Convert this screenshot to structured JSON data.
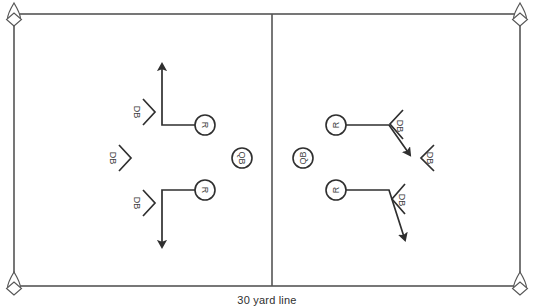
{
  "diagram": {
    "caption": "30 yard line",
    "field": {
      "stroke_color": "#555555",
      "background": "#ffffff",
      "border": {
        "x": 14,
        "y": 14,
        "width": 506,
        "height": 272
      },
      "divider_line_x": 272
    },
    "pylons": [
      {
        "name": "pylon-top-left",
        "x": 14,
        "y": 14
      },
      {
        "name": "pylon-top-right",
        "x": 520,
        "y": 14
      },
      {
        "name": "pylon-bottom-left",
        "x": 14,
        "y": 286
      },
      {
        "name": "pylon-bottom-right",
        "x": 520,
        "y": 286
      }
    ],
    "players": [
      {
        "id": "r-left-top",
        "label": "R",
        "x": 205,
        "y": 125,
        "rotation": 90,
        "role": "receiver"
      },
      {
        "id": "r-left-bottom",
        "label": "R",
        "x": 205,
        "y": 190,
        "rotation": 90,
        "role": "receiver"
      },
      {
        "id": "qb-left",
        "label": "QB",
        "x": 242,
        "y": 158,
        "rotation": 90,
        "role": "quarterback"
      },
      {
        "id": "qb-right",
        "label": "QB",
        "x": 303,
        "y": 158,
        "rotation": -90,
        "role": "quarterback"
      },
      {
        "id": "r-right-top",
        "label": "R",
        "x": 336,
        "y": 125,
        "rotation": -90,
        "role": "receiver"
      },
      {
        "id": "r-right-bottom",
        "label": "R",
        "x": 336,
        "y": 190,
        "rotation": -90,
        "role": "receiver"
      }
    ],
    "defenders": [
      {
        "id": "db-left-top",
        "label": "DB",
        "x": 142,
        "y": 112,
        "direction": "right"
      },
      {
        "id": "db-left-mid",
        "label": "DB",
        "x": 118,
        "y": 158,
        "direction": "right"
      },
      {
        "id": "db-left-bottom",
        "label": "DB",
        "x": 142,
        "y": 203,
        "direction": "right"
      },
      {
        "id": "db-right-top",
        "label": "DB",
        "x": 397,
        "y": 126,
        "direction": "left"
      },
      {
        "id": "db-right-mid",
        "label": "DB",
        "x": 428,
        "y": 158,
        "direction": "left"
      },
      {
        "id": "db-right-bottom",
        "label": "DB",
        "x": 399,
        "y": 200,
        "direction": "left"
      }
    ],
    "routes": [
      {
        "id": "route-left-top",
        "description": "receiver-in-then-up",
        "points": "196,125 162,125 162,62",
        "arrow_at": "162,60"
      },
      {
        "id": "route-left-bottom",
        "description": "receiver-in-then-down",
        "points": "196,190 162,190 162,249",
        "arrow_at": "162,251"
      },
      {
        "id": "route-right-top",
        "description": "receiver-out-diagonal",
        "points": "346,125 389,125 411,157",
        "arrow_at": "413,159"
      },
      {
        "id": "route-right-bottom",
        "description": "receiver-out-diagonal",
        "points": "346,190 389,190 406,243",
        "arrow_at": "407,245"
      }
    ]
  }
}
